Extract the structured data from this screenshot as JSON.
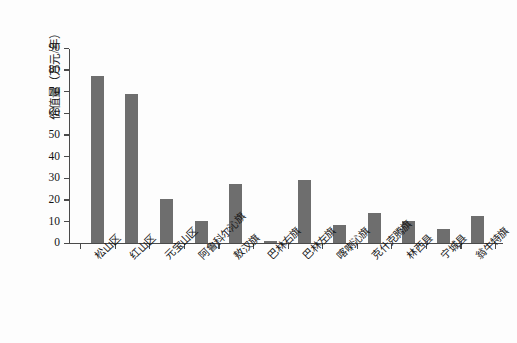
{
  "chart_data": {
    "type": "bar",
    "title": "",
    "xlabel": "",
    "ylabel": "价值量（万元/年）",
    "ylim": [
      0,
      90
    ],
    "ytick_labels": [
      "90",
      "80",
      "70",
      "60",
      "50",
      "40",
      "30",
      "20",
      "10",
      "0"
    ],
    "ytick_values": [
      90,
      80,
      70,
      60,
      50,
      40,
      30,
      20,
      10,
      0
    ],
    "grid": false,
    "legend": "none",
    "bar_color": "#6e6e6e",
    "axis_color": "#4a4a4a",
    "background_color": "#fdfdfd",
    "categories": [
      "松山区",
      "红山区",
      "元宝山区",
      "阿鲁科尔沁旗",
      "敖汉旗",
      "巴林右旗",
      "巴林左旗",
      "喀喇沁旗",
      "克什克腾旗",
      "林西县",
      "宁城县",
      "翁牛特旗"
    ],
    "values": [
      77,
      68.5,
      20,
      9.8,
      27,
      0.6,
      29,
      8,
      13.5,
      10,
      6.5,
      12.5
    ]
  }
}
